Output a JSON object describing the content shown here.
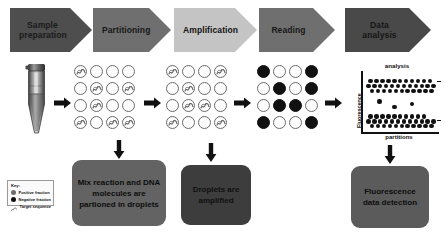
{
  "figure": {
    "caption": ""
  },
  "stages": [
    {
      "id": "sample-preparation",
      "label": "Sample\npreparation",
      "color": "#4e4e4e",
      "style": "b-dark",
      "x": 10,
      "y": 8,
      "w": 82
    },
    {
      "id": "partitioning",
      "label": "Partitioning",
      "color": "#6f6f6f",
      "style": "b-mid",
      "x": 93,
      "y": 8,
      "w": 78
    },
    {
      "id": "amplification",
      "label": "Amplification",
      "color": "#c4c4c4",
      "style": "b-light",
      "x": 174,
      "y": 8,
      "w": 83
    },
    {
      "id": "reading",
      "label": "Reading",
      "color": "#6f6f6f",
      "style": "b-mid",
      "x": 259,
      "y": 8,
      "w": 76
    },
    {
      "id": "data-analysis",
      "label": "Data analysis",
      "color": "#494949",
      "style": "b-dark2",
      "x": 345,
      "y": 8,
      "w": 86
    }
  ],
  "legend": {
    "title": "Key:",
    "items": [
      {
        "label": "Positive fraction",
        "marker": "circle-gray"
      },
      {
        "label": "Negative fraction",
        "marker": "circle-black"
      },
      {
        "label": "Target sequence",
        "marker": "squiggle"
      }
    ]
  },
  "callouts": [
    {
      "id": "partitioning-note",
      "text": "Mix reaction and DNA molecules are partioned in droplets",
      "style": "c-a",
      "x": 72,
      "y": 160,
      "w": 94,
      "h": 66
    },
    {
      "id": "amplification-note",
      "text": "Droplets are amplified",
      "style": "c-b",
      "x": 181,
      "y": 165,
      "w": 70,
      "h": 60
    },
    {
      "id": "detection-note",
      "text": "Fluorescence data detection",
      "style": "c-c",
      "x": 351,
      "y": 166,
      "w": 78,
      "h": 62
    }
  ],
  "grids": {
    "partitioning": {
      "label": "partitioning-droplet-grid",
      "filled": [],
      "squiggles": [
        0,
        7,
        9,
        12,
        14,
        15,
        5
      ]
    },
    "amplification": {
      "label": "amplification-droplet-grid",
      "filled": [],
      "squiggles": [
        0,
        3,
        5,
        9,
        10,
        12,
        15
      ]
    },
    "reading": {
      "label": "reading-droplet-grid",
      "filled": [
        0,
        3,
        5,
        7,
        9,
        10,
        12,
        15
      ]
    }
  },
  "chart_data": {
    "type": "scatter",
    "title": "analysis",
    "xlabel": "partitions",
    "ylabel": "Fluorescence",
    "grid": false,
    "legend": "none",
    "xlim": [
      0,
      100
    ],
    "ylim": [
      0,
      100
    ],
    "series": [
      {
        "name": "Positive partitions (high fluorescence)",
        "color": "#111111",
        "x": [
          6,
          14,
          22,
          30,
          38,
          46,
          54,
          62,
          70,
          78,
          86,
          3,
          11,
          19,
          27,
          35,
          43,
          51,
          59,
          67,
          75,
          83,
          91,
          8,
          16,
          24,
          32,
          40,
          48,
          56,
          64,
          72,
          80,
          88
        ],
        "y": [
          88,
          88,
          88,
          88,
          88,
          88,
          88,
          88,
          88,
          88,
          88,
          80,
          80,
          80,
          80,
          80,
          80,
          80,
          80,
          80,
          80,
          80,
          80,
          72,
          72,
          72,
          72,
          72,
          72,
          72,
          72,
          72,
          72,
          72
        ]
      },
      {
        "name": "Intermediate / rain partitions",
        "color": "#111111",
        "x": [
          18,
          38,
          62
        ],
        "y": [
          54,
          44,
          50
        ]
      },
      {
        "name": "Negative partitions (low fluorescence)",
        "color": "#111111",
        "x": [
          6,
          14,
          22,
          30,
          38,
          46,
          54,
          62,
          70,
          78,
          3,
          11,
          19,
          27,
          35,
          43,
          51,
          59,
          67,
          75,
          83,
          91,
          8,
          16,
          24,
          32,
          40,
          48,
          56,
          64,
          72,
          80,
          88
        ],
        "y": [
          28,
          28,
          28,
          28,
          28,
          28,
          28,
          28,
          28,
          28,
          20,
          20,
          20,
          20,
          20,
          20,
          20,
          20,
          20,
          20,
          20,
          20,
          12,
          12,
          12,
          12,
          12,
          12,
          12,
          12,
          12,
          12,
          12
        ]
      }
    ]
  },
  "flow_arrows": [
    {
      "id": "arrow-sample-to-partition",
      "direction": "right"
    },
    {
      "id": "arrow-partition-to-amplify",
      "direction": "right"
    },
    {
      "id": "arrow-amplify-to-reading",
      "direction": "right"
    },
    {
      "id": "arrow-reading-to-analysis",
      "direction": "right"
    },
    {
      "id": "arrow-partition-down",
      "direction": "down"
    },
    {
      "id": "arrow-amplify-down",
      "direction": "down"
    },
    {
      "id": "arrow-analysis-down",
      "direction": "down"
    }
  ]
}
